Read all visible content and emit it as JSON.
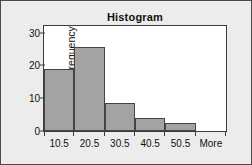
{
  "chart_data": {
    "type": "bar",
    "title": "Histogram",
    "xlabel": "",
    "ylabel": "Frequency",
    "categories": [
      "10.5",
      "20.5",
      "30.5",
      "40.5",
      "50.5",
      "More"
    ],
    "values": [
      19,
      25.5,
      8.5,
      4,
      2.5,
      0
    ],
    "ylim": [
      0,
      32
    ],
    "y_ticks": [
      0,
      10,
      20,
      30
    ],
    "y_tick_labels": [
      "0",
      "10",
      "20",
      "30"
    ],
    "x_tick_labels": [
      "10.5",
      "20.5",
      "30.5",
      "40.5",
      "50.5",
      "More"
    ],
    "grid": false,
    "legend": null,
    "bar_color": "#a3a3a3",
    "bar_edge_color": "#454545",
    "plot_background": "#ffffff",
    "figure_background": "#ececec",
    "border_color": "#4a4a4a"
  }
}
